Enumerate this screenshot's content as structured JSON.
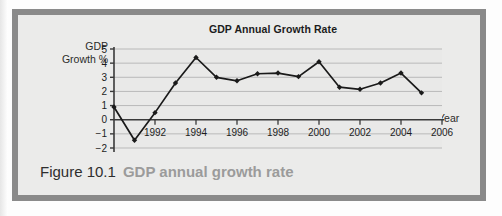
{
  "figure": {
    "caption_number": "Figure 10.1",
    "caption_text": "GDP annual growth rate"
  },
  "chart_data": {
    "type": "line",
    "title": "GDP Annual Growth Rate",
    "xlabel": "Year",
    "ylabel": "GDP Growth %",
    "ylabel_line1": "GDP",
    "ylabel_line2": "Growth %",
    "grid": true,
    "legend": "none",
    "xlim": [
      1990,
      2006
    ],
    "ylim": [
      -2,
      5
    ],
    "ytick_labels": [
      "5",
      "4",
      "3",
      "2",
      "1",
      "0",
      "−1",
      "−2"
    ],
    "yticks": [
      5,
      4,
      3,
      2,
      1,
      0,
      -1,
      -2
    ],
    "xtick_labels": [
      "1992",
      "1994",
      "1996",
      "1998",
      "2000",
      "2002",
      "2004",
      "2006"
    ],
    "xticks": [
      1992,
      1994,
      1996,
      1998,
      2000,
      2002,
      2004,
      2006
    ],
    "x": [
      1990,
      1991,
      1992,
      1993,
      1994,
      1995,
      1996,
      1997,
      1998,
      1999,
      2000,
      2001,
      2002,
      2003,
      2004,
      2005
    ],
    "values": [
      0.9,
      -1.45,
      0.5,
      2.6,
      4.4,
      3.0,
      2.75,
      3.25,
      3.3,
      3.05,
      4.1,
      2.3,
      2.15,
      2.6,
      3.3,
      1.9
    ],
    "series": [
      {
        "name": "GDP Annual Growth Rate",
        "values": [
          0.9,
          -1.45,
          0.5,
          2.6,
          4.4,
          3.0,
          2.75,
          3.25,
          3.3,
          3.05,
          4.1,
          2.3,
          2.15,
          2.6,
          3.3,
          1.9
        ]
      }
    ],
    "marker": "diamond",
    "line_color": "#1a1a1a",
    "grid_color": "#b9b9b9",
    "axis_color": "#3a3a3a",
    "plot_background": "#e9e9e8"
  }
}
